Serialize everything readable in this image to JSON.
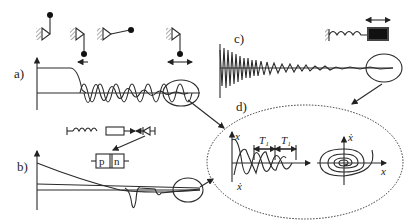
{
  "panels": {
    "a": {
      "label": "a)"
    },
    "b": {
      "label": "b)"
    },
    "c": {
      "label": "c)"
    },
    "d": {
      "label": "d)"
    }
  },
  "circuit": {
    "p_label": "p",
    "n_label": "n"
  },
  "annotations": {
    "x_axis": "x",
    "x_dot_axis": "ẋ",
    "period_1": "T₁",
    "period_2": "T₁",
    "phase_x": "x",
    "phase_xdot": "ẋ"
  }
}
